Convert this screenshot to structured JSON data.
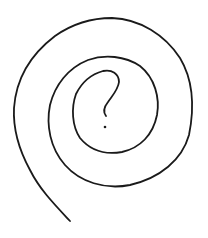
{
  "figure": {
    "description": "Hand-drawn spiral with a question mark at its center",
    "symbol": "?",
    "stroke_color": "#1a1a1a",
    "background_color": "#ffffff"
  }
}
